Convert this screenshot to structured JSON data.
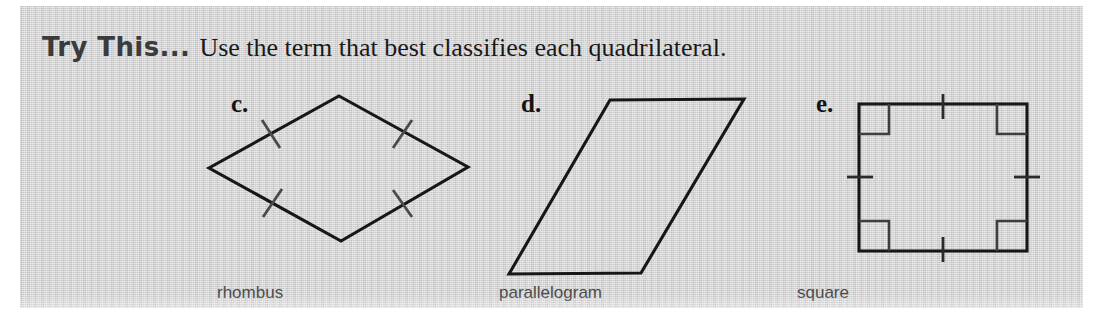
{
  "page": {
    "background_color": "#ffffff",
    "panel_color": "#c9c9c9"
  },
  "header": {
    "callout_label": "Try This...",
    "instruction": "Use the term that best classifies each quadrilateral.",
    "callout_color": "#3b3b3b",
    "text_color": "#191919"
  },
  "figures": [
    {
      "letter": "c.",
      "caption": "rhombus",
      "shape": "rhombus",
      "marks": {
        "congruent_side_ticks": 4,
        "right_angle_marks": 0
      }
    },
    {
      "letter": "d.",
      "caption": "parallelogram",
      "shape": "parallelogram",
      "marks": {
        "congruent_side_ticks": 0,
        "right_angle_marks": 0
      }
    },
    {
      "letter": "e.",
      "caption": "square",
      "shape": "square",
      "marks": {
        "congruent_side_ticks": 4,
        "right_angle_marks": 4
      }
    }
  ],
  "captions": {
    "rhombus": "rhombus",
    "parallelogram": "parallelogram",
    "square": "square",
    "color": "#4b4b4b"
  },
  "stroke_colors": {
    "shape_outline": "#171717",
    "tick_mark": "#4a4a4a",
    "right_angle": "#3e3e3e"
  }
}
